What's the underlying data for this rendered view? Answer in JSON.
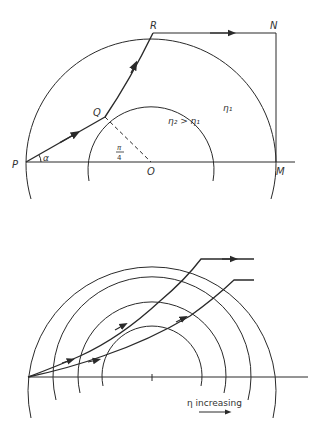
{
  "figure_top": {
    "points": {
      "P": "P",
      "Q": "Q",
      "R": "R",
      "N": "N",
      "M": "M",
      "O": "O"
    },
    "angle_label": "α",
    "angle_pi_num": "π",
    "angle_pi_den": "4",
    "inner_region_label": "η₂ > η₁",
    "outer_region_label": "η₁"
  },
  "figure_bottom": {
    "caption": "η increasing",
    "circle_count": 4,
    "ray_count": 2
  },
  "colors": {
    "line": "#2a2a2a",
    "background": "#ffffff"
  }
}
